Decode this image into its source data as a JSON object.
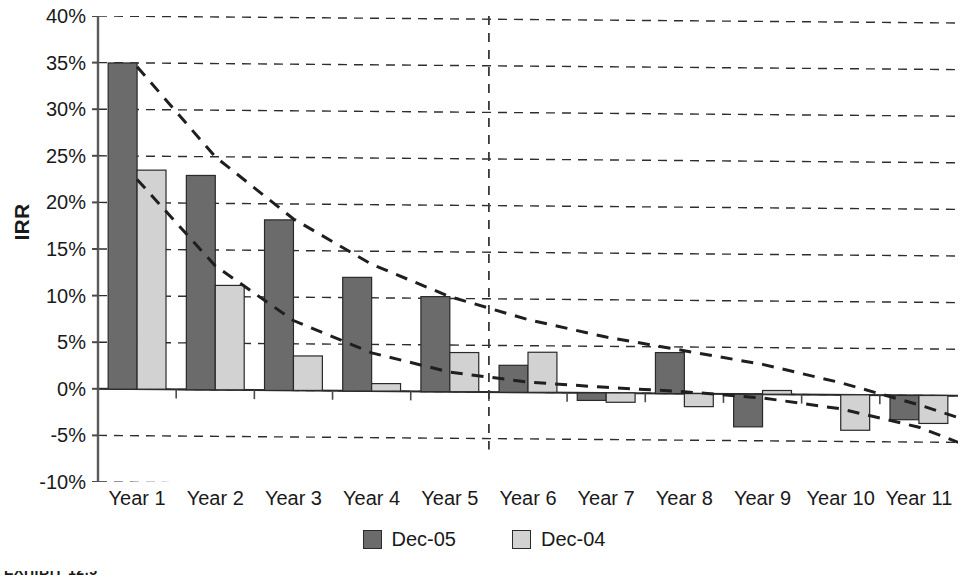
{
  "chart_data": {
    "type": "bar",
    "title": "",
    "xlabel": "",
    "ylabel": "IRR",
    "ylim": [
      -10,
      40
    ],
    "ytick_step": 5,
    "ytick_labels": [
      "40%",
      "35%",
      "30%",
      "25%",
      "20%",
      "15%",
      "10%",
      "5%",
      "0%",
      "-5%",
      "-10%"
    ],
    "ytick_values": [
      40,
      35,
      30,
      25,
      20,
      15,
      10,
      5,
      0,
      -5,
      -10
    ],
    "grid": true,
    "grid_style": "dashed-horizontal",
    "legend_position": "bottom-center",
    "categories": [
      "Year 1",
      "Year 2",
      "Year 3",
      "Year 4",
      "Year 5",
      "Year 6",
      "Year 7",
      "Year 8",
      "Year 9",
      "Year 10",
      "Year 11"
    ],
    "series": [
      {
        "name": "Dec-05",
        "color": "#6b6b6b",
        "values": [
          35.0,
          23.0,
          18.3,
          12.2,
          10.2,
          2.9,
          -0.8,
          4.4,
          -3.5,
          0.0,
          -2.6
        ]
      },
      {
        "name": "Dec-04",
        "color": "#d2d2d2",
        "values": [
          23.5,
          11.2,
          3.7,
          0.8,
          4.2,
          4.3,
          -1.0,
          -1.4,
          0.4,
          -3.8,
          -3.0
        ]
      }
    ],
    "trendlines": [
      {
        "name": "Dec-05 trend",
        "style": "dashed",
        "points": [
          [
            0,
            34.6
          ],
          [
            1,
            25.0
          ],
          [
            2,
            18.4
          ],
          [
            3,
            13.6
          ],
          [
            4,
            10.2
          ],
          [
            5,
            7.8
          ],
          [
            6,
            6.0
          ],
          [
            7,
            4.6
          ],
          [
            8,
            3.2
          ],
          [
            9,
            1.3
          ],
          [
            10,
            -1.0
          ],
          [
            10.6,
            -2.6
          ]
        ]
      },
      {
        "name": "Dec-04 trend",
        "style": "dashed",
        "points": [
          [
            0,
            22.5
          ],
          [
            1,
            13.3
          ],
          [
            2,
            7.5
          ],
          [
            3,
            4.1
          ],
          [
            4,
            2.1
          ],
          [
            5,
            1.1
          ],
          [
            6,
            0.6
          ],
          [
            7,
            0.2
          ],
          [
            8,
            -0.4
          ],
          [
            9,
            -1.5
          ],
          [
            10,
            -3.4
          ],
          [
            10.6,
            -5.3
          ]
        ]
      }
    ],
    "vertical_marker": {
      "name": "year-5-6-divider",
      "style": "dashed",
      "x_between": [
        4,
        5
      ],
      "y_top": 40,
      "y_bottom": -6.5
    },
    "annotations": []
  },
  "caption": {
    "text": "EXHIBIT 12.5"
  }
}
